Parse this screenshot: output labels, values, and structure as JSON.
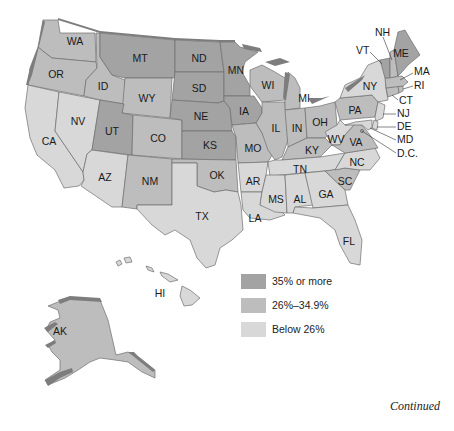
{
  "legend": {
    "items": [
      {
        "label": "35% or more",
        "color": "#a3a3a3"
      },
      {
        "label": "26%–34.9%",
        "color": "#bdbdbd"
      },
      {
        "label": "Below 26%",
        "color": "#d8d8d8"
      }
    ]
  },
  "footer": {
    "continued": "Continued"
  },
  "colors": {
    "high": "#a3a3a3",
    "mid": "#bdbdbd",
    "low": "#d8d8d8",
    "water": "#7d7d7d",
    "border": "#6e6e6e"
  },
  "states": {
    "WA": {
      "label": "WA",
      "category": "26%–34.9%"
    },
    "OR": {
      "label": "OR",
      "category": "26%–34.9%"
    },
    "CA": {
      "label": "CA",
      "category": "Below 26%"
    },
    "NV": {
      "label": "NV",
      "category": "Below 26%"
    },
    "ID": {
      "label": "ID",
      "category": "26%–34.9%"
    },
    "MT": {
      "label": "MT",
      "category": "35% or more"
    },
    "WY": {
      "label": "WY",
      "category": "26%–34.9%"
    },
    "UT": {
      "label": "UT",
      "category": "35% or more"
    },
    "AZ": {
      "label": "AZ",
      "category": "Below 26%"
    },
    "CO": {
      "label": "CO",
      "category": "26%–34.9%"
    },
    "NM": {
      "label": "NM",
      "category": "26%–34.9%"
    },
    "ND": {
      "label": "ND",
      "category": "35% or more"
    },
    "SD": {
      "label": "SD",
      "category": "35% or more"
    },
    "NE": {
      "label": "NE",
      "category": "35% or more"
    },
    "KS": {
      "label": "KS",
      "category": "35% or more"
    },
    "OK": {
      "label": "OK",
      "category": "26%–34.9%"
    },
    "TX": {
      "label": "TX",
      "category": "Below 26%"
    },
    "MN": {
      "label": "MN",
      "category": "35% or more"
    },
    "IA": {
      "label": "IA",
      "category": "35% or more"
    },
    "MO": {
      "label": "MO",
      "category": "26%–34.9%"
    },
    "AR": {
      "label": "AR",
      "category": "Below 26%"
    },
    "LA": {
      "label": "LA",
      "category": "Below 26%"
    },
    "WI": {
      "label": "WI",
      "category": "26%–34.9%"
    },
    "IL": {
      "label": "IL",
      "category": "26%–34.9%"
    },
    "MI": {
      "label": "MI",
      "category": "26%–34.9%"
    },
    "IN": {
      "label": "IN",
      "category": "26%–34.9%"
    },
    "OH": {
      "label": "OH",
      "category": "26%–34.9%"
    },
    "KY": {
      "label": "KY",
      "category": "26%–34.9%"
    },
    "TN": {
      "label": "TN",
      "category": "Below 26%"
    },
    "MS": {
      "label": "MS",
      "category": "Below 26%"
    },
    "AL": {
      "label": "AL",
      "category": "Below 26%"
    },
    "GA": {
      "label": "GA",
      "category": "Below 26%"
    },
    "FL": {
      "label": "FL",
      "category": "Below 26%"
    },
    "SC": {
      "label": "SC",
      "category": "26%–34.9%"
    },
    "NC": {
      "label": "NC",
      "category": "Below 26%"
    },
    "VA": {
      "label": "VA",
      "category": "26%–34.9%"
    },
    "WV": {
      "label": "WV",
      "category": "Below 26%"
    },
    "PA": {
      "label": "PA",
      "category": "26%–34.9%"
    },
    "NY": {
      "label": "NY",
      "category": "Below 26%"
    },
    "NJ": {
      "label": "NJ",
      "category": "Below 26%"
    },
    "DE": {
      "label": "DE",
      "category": "Below 26%"
    },
    "MD": {
      "label": "MD",
      "category": "Below 26%"
    },
    "DC": {
      "label": "D.C.",
      "category": "Below 26%"
    },
    "CT": {
      "label": "CT",
      "category": "26%–34.9%"
    },
    "RI": {
      "label": "RI",
      "category": "26%–34.9%"
    },
    "MA": {
      "label": "MA",
      "category": "26%–34.9%"
    },
    "VT": {
      "label": "VT",
      "category": "35% or more"
    },
    "NH": {
      "label": "NH",
      "category": "26%–34.9%"
    },
    "ME": {
      "label": "ME",
      "category": "35% or more"
    },
    "AK": {
      "label": "AK",
      "category": "26%–34.9%"
    },
    "HI": {
      "label": "HI",
      "category": "Below 26%"
    }
  }
}
